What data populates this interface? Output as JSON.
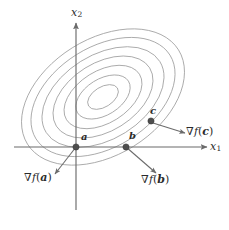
{
  "figure": {
    "type": "contour-plot-with-gradient-vectors",
    "background_color": "#ffffff",
    "axis_color": "#6b6b6b",
    "contour_color": "#9a9a9a",
    "point_color": "#4d4d4d",
    "arrow_color": "#6b6b6b",
    "text_color": "#2b2b2b"
  },
  "axes": {
    "x_label": "x",
    "x_sub": "1",
    "y_label": "x",
    "y_sub": "2",
    "origin": {
      "x": 76,
      "y": 147
    }
  },
  "points": [
    {
      "id": "a",
      "label": "a",
      "x": 76,
      "y": 147,
      "label_dx": 5,
      "label_dy": -13
    },
    {
      "id": "b",
      "label": "b",
      "x": 126,
      "y": 147,
      "label_dx": 3,
      "label_dy": -14
    },
    {
      "id": "c",
      "label": "c",
      "x": 151,
      "y": 121,
      "label_dx": -1,
      "label_dy": -14
    }
  ],
  "gradients": [
    {
      "id": "grad-a",
      "nabla": "∇",
      "f": "f",
      "open": "(",
      "vector": "a",
      "close": ")",
      "from": {
        "x": 76,
        "y": 147
      },
      "to": {
        "x": 55,
        "y": 174
      },
      "label_x": 24,
      "label_y": 178
    },
    {
      "id": "grad-b",
      "nabla": "∇",
      "f": "f",
      "open": "(",
      "vector": "b",
      "close": ")",
      "from": {
        "x": 126,
        "y": 147
      },
      "to": {
        "x": 156,
        "y": 173
      },
      "label_x": 141,
      "label_y": 180
    },
    {
      "id": "grad-c",
      "nabla": "∇",
      "f": "f",
      "open": "(",
      "vector": "c",
      "close": ")",
      "from": {
        "x": 153,
        "y": 123
      },
      "to": {
        "x": 185,
        "y": 133
      },
      "label_x": 187,
      "label_y": 124
    }
  ],
  "chart_data": {
    "type": "contour",
    "title": "",
    "xlabel": "x_1",
    "ylabel": "x_2",
    "grid": false,
    "legend": false,
    "center": {
      "x": 103,
      "y": 97
    },
    "rotation_deg": -32,
    "levels": [
      {
        "rx": 17,
        "ry": 10
      },
      {
        "rx": 30,
        "ry": 18
      },
      {
        "rx": 43,
        "ry": 26
      },
      {
        "rx": 55,
        "ry": 34
      },
      {
        "rx": 67,
        "ry": 42
      },
      {
        "rx": 79,
        "ry": 50
      },
      {
        "rx": 89,
        "ry": 58
      }
    ],
    "annotations": [
      {
        "text": "a",
        "x": 76,
        "y": 147
      },
      {
        "text": "b",
        "x": 126,
        "y": 147
      },
      {
        "text": "c",
        "x": 151,
        "y": 121
      },
      {
        "text": "grad f(a)",
        "x": 24,
        "y": 178
      },
      {
        "text": "grad f(b)",
        "x": 141,
        "y": 180
      },
      {
        "text": "grad f(c)",
        "x": 187,
        "y": 124
      }
    ]
  }
}
